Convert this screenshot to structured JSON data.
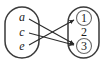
{
  "figure": {
    "type": "arrow-mapping-diagram",
    "background_color": "#ffffff",
    "oval_stroke_color": "#3a3a3a",
    "arrow_color": "#2b2b2b",
    "ring_color": "#6a6a6a"
  },
  "domain_set": {
    "name": "domain-oval",
    "style": "italic",
    "elements": [
      {
        "label": "a",
        "cx": 22,
        "cy": 17
      },
      {
        "label": "c",
        "cx": 22,
        "cy": 32
      },
      {
        "label": "e",
        "cx": 22,
        "cy": 46
      }
    ]
  },
  "codomain_set": {
    "name": "codomain-oval",
    "style": "upright",
    "elements": [
      {
        "label": "1",
        "cx": 84,
        "cy": 18,
        "circled": true
      },
      {
        "label": "2",
        "cx": 84,
        "cy": 32,
        "circled": false
      },
      {
        "label": "3",
        "cx": 84,
        "cy": 46,
        "circled": true
      }
    ]
  },
  "mappings": [
    {
      "from": "a",
      "to": "3",
      "x1": 29,
      "y1": 19,
      "x2": 74,
      "y2": 44
    },
    {
      "from": "c",
      "to": "3",
      "x1": 29,
      "y1": 33,
      "x2": 74,
      "y2": 45
    },
    {
      "from": "e",
      "to": "1",
      "x1": 29,
      "y1": 45,
      "x2": 74,
      "y2": 20
    }
  ],
  "legend": {
    "note": "Circled codomain elements indicate the image of the mapping."
  }
}
